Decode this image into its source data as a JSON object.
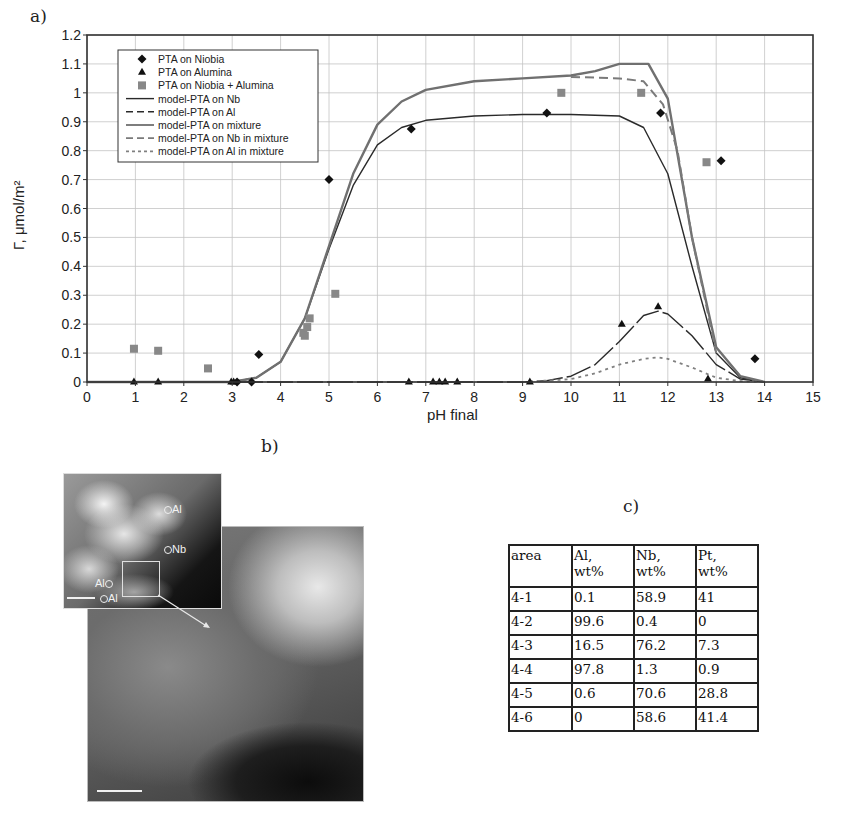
{
  "panels": {
    "a_label": "a)",
    "b_label": "b)",
    "c_label": "c)"
  },
  "chart_data": {
    "type": "scatter",
    "title": "",
    "xlabel": "pH final",
    "ylabel": "Γ, μmol/m²",
    "xlim": [
      0,
      15
    ],
    "ylim": [
      0,
      1.2
    ],
    "x_ticks": [
      "0",
      "1",
      "2",
      "3",
      "4",
      "5",
      "6",
      "7",
      "8",
      "9",
      "10",
      "11",
      "12",
      "13",
      "14",
      "15"
    ],
    "y_ticks": [
      "0",
      "0.1",
      "0.2",
      "0.3",
      "0.4",
      "0.5",
      "0.6",
      "0.7",
      "0.8",
      "0.9",
      "1",
      "1.1",
      "1.2"
    ],
    "grid": true,
    "legend_position": "upper-left inside",
    "legend": [
      {
        "label": "PTA on Niobia",
        "marker": "diamond"
      },
      {
        "label": "PTA on Alumina",
        "marker": "triangle"
      },
      {
        "label": "PTA on Niobia + Alumina",
        "marker": "square"
      },
      {
        "label": "model-PTA on Nb",
        "line": "solid-dark"
      },
      {
        "label": "model-PTA on Al",
        "line": "solid-dark"
      },
      {
        "label": "model-PTA on mixture",
        "line": "solid-gray"
      },
      {
        "label": "model-PTA on Nb in mixture",
        "line": "dashed"
      },
      {
        "label": "model-PTA on Al in mixture",
        "line": "dotted"
      }
    ],
    "series": [
      {
        "name": "PTA on Niobia",
        "kind": "points",
        "x": [
          3.1,
          3.4,
          3.55,
          5.0,
          6.7,
          9.5,
          11.85,
          13.1,
          13.8
        ],
        "y": [
          0.0,
          0.0,
          0.095,
          0.7,
          0.875,
          0.93,
          0.93,
          0.765,
          0.08
        ]
      },
      {
        "name": "PTA on Alumina",
        "kind": "points",
        "x": [
          0.97,
          1.47,
          2.98,
          3.03,
          6.65,
          7.15,
          7.28,
          7.4,
          7.65,
          9.15,
          11.05,
          11.8,
          12.83
        ],
        "y": [
          0.0,
          0.0,
          0.0,
          0.0,
          0.0,
          0.0,
          0.0,
          0.0,
          0.0,
          0.0,
          0.2,
          0.26,
          0.01
        ]
      },
      {
        "name": "PTA on Niobia + Alumina",
        "kind": "points",
        "x": [
          0.97,
          1.47,
          2.5,
          4.47,
          4.5,
          4.55,
          4.6,
          5.13,
          9.8,
          11.45,
          12.8
        ],
        "y": [
          0.115,
          0.108,
          0.047,
          0.17,
          0.16,
          0.19,
          0.22,
          0.305,
          1.0,
          1.0,
          0.76
        ]
      },
      {
        "name": "model-PTA on Nb",
        "kind": "line",
        "x": [
          0,
          3.0,
          3.5,
          4.0,
          4.5,
          5.0,
          5.5,
          6.0,
          6.5,
          7.0,
          8.0,
          9.0,
          10.0,
          11.0,
          11.5,
          12.0,
          12.5,
          13.0,
          13.5,
          14.0
        ],
        "y": [
          0,
          0.0,
          0.015,
          0.07,
          0.22,
          0.46,
          0.68,
          0.82,
          0.88,
          0.905,
          0.92,
          0.925,
          0.925,
          0.92,
          0.88,
          0.72,
          0.4,
          0.1,
          0.015,
          0.0
        ]
      },
      {
        "name": "model-PTA on Al",
        "kind": "line",
        "x": [
          0,
          9.0,
          9.5,
          10.0,
          10.5,
          11.0,
          11.5,
          11.8,
          12.0,
          12.5,
          13.0,
          13.5,
          14.0
        ],
        "y": [
          0,
          0.0,
          0.005,
          0.02,
          0.06,
          0.14,
          0.23,
          0.245,
          0.235,
          0.16,
          0.06,
          0.01,
          0.0
        ]
      },
      {
        "name": "model-PTA on mixture",
        "kind": "line",
        "x": [
          0,
          3.0,
          3.5,
          4.0,
          4.5,
          5.0,
          5.5,
          6.0,
          6.5,
          7.0,
          8.0,
          9.0,
          10.0,
          10.5,
          11.0,
          11.6,
          12.0,
          12.5,
          13.0,
          13.5,
          14.0
        ],
        "y": [
          0,
          0.0,
          0.015,
          0.07,
          0.22,
          0.47,
          0.72,
          0.89,
          0.97,
          1.01,
          1.04,
          1.05,
          1.06,
          1.075,
          1.1,
          1.1,
          0.98,
          0.5,
          0.12,
          0.02,
          0.0
        ]
      },
      {
        "name": "model-PTA on Nb in mixture",
        "kind": "line",
        "x": [
          10.0,
          11.0,
          11.5,
          11.9,
          12.2,
          12.5,
          13.0
        ],
        "y": [
          1.055,
          1.05,
          1.04,
          0.96,
          0.8,
          0.5,
          0.1
        ]
      },
      {
        "name": "model-PTA on Al in mixture",
        "kind": "line",
        "x": [
          9.0,
          10.0,
          10.5,
          11.0,
          11.5,
          11.8,
          12.0,
          12.5,
          13.0,
          13.5,
          14.0
        ],
        "y": [
          0.0,
          0.01,
          0.03,
          0.06,
          0.08,
          0.085,
          0.08,
          0.05,
          0.015,
          0.003,
          0.0
        ]
      }
    ]
  },
  "micrograph": {
    "labels": [
      "Al",
      "Nb",
      "Al",
      "Al"
    ]
  },
  "table": {
    "headers": [
      {
        "line1": "area",
        "line2": ""
      },
      {
        "line1": "Al,",
        "line2": "wt%"
      },
      {
        "line1": "Nb,",
        "line2": "wt%"
      },
      {
        "line1": "Pt,",
        "line2": "wt%"
      }
    ],
    "rows": [
      [
        "4-1",
        "0.1",
        "58.9",
        "41"
      ],
      [
        "4-2",
        "99.6",
        "0.4",
        "0"
      ],
      [
        "4-3",
        "16.5",
        "76.2",
        "7.3"
      ],
      [
        "4-4",
        "97.8",
        "1.3",
        "0.9"
      ],
      [
        "4-5",
        "0.6",
        "70.6",
        "28.8"
      ],
      [
        "4-6",
        "0",
        "58.6",
        "41.4"
      ]
    ]
  }
}
